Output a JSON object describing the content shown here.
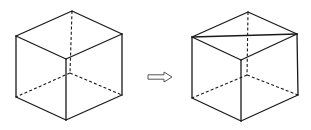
{
  "figure": {
    "colors": {
      "line": "#1a1a1a",
      "arrow": "#555555",
      "background": "#ffffff"
    },
    "cubes": [
      {
        "id": "left-cube",
        "vertices": {
          "top_back": [
            72,
            11
          ],
          "top_left": [
            16,
            36
          ],
          "top_right": [
            122,
            34
          ],
          "top_front": [
            66,
            59
          ],
          "bottom_left": [
            16,
            97
          ],
          "bottom_right": [
            122,
            95
          ],
          "bottom_front": [
            66,
            120
          ],
          "bottom_back": [
            70,
            73
          ]
        },
        "solid_edges": [
          [
            "top_back",
            "top_left"
          ],
          [
            "top_back",
            "top_right"
          ],
          [
            "top_left",
            "top_front"
          ],
          [
            "top_right",
            "top_front"
          ],
          [
            "top_left",
            "bottom_left"
          ],
          [
            "top_right",
            "bottom_right"
          ],
          [
            "top_front",
            "bottom_front"
          ],
          [
            "bottom_left",
            "bottom_front"
          ],
          [
            "bottom_right",
            "bottom_front"
          ]
        ],
        "hidden_edges": [
          [
            "top_back",
            "bottom_back"
          ],
          [
            "bottom_back",
            "bottom_left"
          ],
          [
            "bottom_back",
            "bottom_right"
          ]
        ],
        "extra_edges": []
      },
      {
        "id": "right-cube",
        "vertices": {
          "top_back": [
            248,
            12
          ],
          "top_left": [
            192,
            37
          ],
          "top_right": [
            297,
            34
          ],
          "top_front": [
            241,
            60
          ],
          "bottom_left": [
            192,
            98
          ],
          "bottom_right": [
            298,
            95
          ],
          "bottom_front": [
            241,
            121
          ],
          "bottom_back": [
            247,
            75
          ]
        },
        "solid_edges": [
          [
            "top_back",
            "top_left"
          ],
          [
            "top_back",
            "top_right"
          ],
          [
            "top_left",
            "top_front"
          ],
          [
            "top_right",
            "top_front"
          ],
          [
            "top_left",
            "bottom_left"
          ],
          [
            "top_right",
            "bottom_right"
          ],
          [
            "top_front",
            "bottom_front"
          ],
          [
            "bottom_left",
            "bottom_front"
          ],
          [
            "bottom_right",
            "bottom_front"
          ]
        ],
        "hidden_edges": [
          [
            "top_back",
            "bottom_back"
          ],
          [
            "bottom_back",
            "bottom_left"
          ],
          [
            "bottom_back",
            "bottom_right"
          ]
        ],
        "extra_edges": [
          [
            "top_left",
            "top_right"
          ]
        ]
      }
    ],
    "arrow": {
      "x1": 148,
      "x2": 172,
      "y": 77,
      "label": ""
    }
  }
}
